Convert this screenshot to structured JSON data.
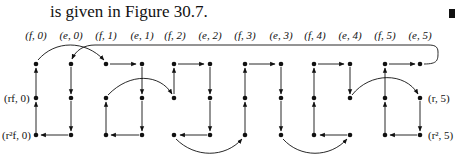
{
  "text": {
    "intro": "is given in Figure 30.7."
  },
  "figure": {
    "column_labels": [
      "(f, 0)",
      "(e, 0)",
      "(f, 1)",
      "(e, 1)",
      "(f, 2)",
      "(e, 2)",
      "(f, 3)",
      "(e, 3)",
      "(f, 4)",
      "(e, 4)",
      "(f, 5)",
      "(e, 5)"
    ],
    "left_labels": [
      "(rf, 0)",
      "(r²f, 0)"
    ],
    "right_labels": [
      "(r, 5)",
      "(r², 5)"
    ],
    "rows": 3,
    "columns": 12,
    "colors": {
      "ink": "#111111",
      "background": "#ffffff"
    }
  }
}
